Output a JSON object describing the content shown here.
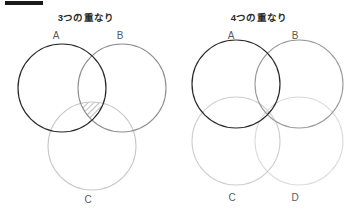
{
  "document": {
    "background_color": "#ffffff",
    "redaction_bar": {
      "present": true,
      "color": "#1a1a1a"
    }
  },
  "panels": [
    {
      "id": "three-overlap",
      "title": "3つの重なり",
      "circle_count": 3,
      "arrangement": "triangular-venn",
      "circles": [
        {
          "label": "A",
          "color": "#2a2a2a",
          "cx": 62,
          "cy": 62,
          "r": 44,
          "label_x": 56,
          "label_y": 4
        },
        {
          "label": "B",
          "color": "#8e8e8e",
          "cx": 122,
          "cy": 62,
          "r": 44,
          "label_x": 120,
          "label_y": 4
        },
        {
          "label": "C",
          "color": "#c9c9c9",
          "cx": 92,
          "cy": 120,
          "r": 44,
          "label_x": 88,
          "label_y": 168
        }
      ],
      "highlight": {
        "region": "A∩B∩C",
        "fill": "hatch-diagonal",
        "hatch_color": "#6b6b6b",
        "outline_color": "#555555",
        "size": "large"
      }
    },
    {
      "id": "four-overlap",
      "title": "4つの重なり",
      "circle_count": 4,
      "arrangement": "grid-2x2",
      "circles": [
        {
          "label": "A",
          "color": "#2a2a2a",
          "cx": 63,
          "cy": 58,
          "r": 44,
          "label_x": 58,
          "label_y": 4
        },
        {
          "label": "B",
          "color": "#9a9a9a",
          "cx": 126,
          "cy": 58,
          "r": 44,
          "label_x": 122,
          "label_y": 4
        },
        {
          "label": "C",
          "color": "#d0d0d0",
          "cx": 63,
          "cy": 115,
          "r": 44,
          "label_x": 59,
          "label_y": 166
        },
        {
          "label": "D",
          "color": "#dcdcdc",
          "cx": 126,
          "cy": 115,
          "r": 44,
          "label_x": 122,
          "label_y": 166
        }
      ],
      "highlight": {
        "region": "A∩B∩C∩D",
        "fill": "hatch-diagonal",
        "hatch_color": "#6b6b6b",
        "outline_color": "#777777",
        "size": "small"
      }
    }
  ]
}
